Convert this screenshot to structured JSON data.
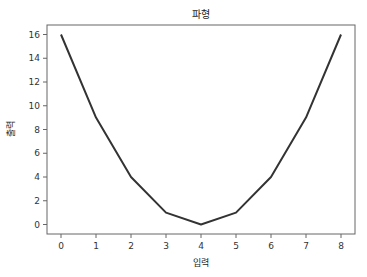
{
  "chart_data": {
    "type": "line",
    "title": "파형",
    "xlabel": "입력",
    "ylabel": "출력",
    "x": [
      0,
      1,
      2,
      3,
      4,
      5,
      6,
      7,
      8
    ],
    "series": [
      {
        "name": "",
        "values": [
          16,
          9,
          4,
          1,
          0,
          1,
          4,
          9,
          16
        ],
        "color": "#333333"
      }
    ],
    "xticks": [
      0,
      1,
      2,
      3,
      4,
      5,
      6,
      7,
      8
    ],
    "yticks": [
      0,
      2,
      4,
      6,
      8,
      10,
      12,
      14,
      16
    ],
    "xlim": [
      -0.4,
      8.4
    ],
    "ylim": [
      -0.8,
      16.8
    ],
    "grid": false,
    "legend": null
  }
}
